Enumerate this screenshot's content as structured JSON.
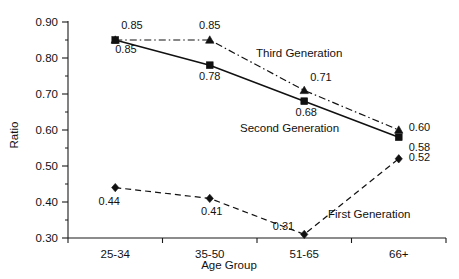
{
  "chart_data": {
    "type": "line",
    "title": "",
    "xlabel": "Age Group",
    "ylabel": "Ratio",
    "categories": [
      "25-34",
      "35-50",
      "51-65",
      "66+"
    ],
    "ylim": [
      0.3,
      0.9
    ],
    "ytick_labels": [
      "0.30",
      "0.40",
      "0.50",
      "0.60",
      "0.70",
      "0.80",
      "0.90"
    ],
    "ytick_values": [
      0.3,
      0.4,
      0.5,
      0.6,
      0.7,
      0.8,
      0.9
    ],
    "yminor_values": [
      0.35,
      0.45,
      0.55,
      0.65,
      0.75,
      0.85
    ],
    "grid": false,
    "legend_position": "inline-annotations",
    "series": [
      {
        "name": "Third Generation",
        "marker": "triangle",
        "linestyle": "dash-dot",
        "color": "#111111",
        "values": [
          0.85,
          0.85,
          0.71,
          0.6
        ],
        "value_labels": [
          "0.85",
          "0.85",
          "0.71",
          "0.60"
        ]
      },
      {
        "name": "Second Generation",
        "marker": "square",
        "linestyle": "solid",
        "color": "#111111",
        "values": [
          0.85,
          0.78,
          0.68,
          0.58
        ],
        "value_labels": [
          "0.85",
          "0.78",
          "0.68",
          "0.58"
        ]
      },
      {
        "name": "First Generation",
        "marker": "diamond",
        "linestyle": "dashed",
        "color": "#111111",
        "values": [
          0.44,
          0.41,
          0.31,
          0.52
        ],
        "value_labels": [
          "0.44",
          "0.41",
          "0.31",
          "0.52"
        ]
      }
    ],
    "annotations": [
      {
        "text": "Third Generation",
        "series": "Third Generation"
      },
      {
        "text": "Second Generation",
        "series": "Second Generation"
      },
      {
        "text": "First Generation",
        "series": "First Generation"
      }
    ]
  }
}
